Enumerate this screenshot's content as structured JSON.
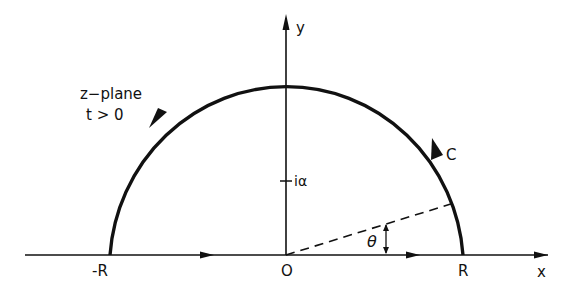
{
  "diagram": {
    "title_lines": [
      "z−plane",
      "t > 0"
    ],
    "axes": {
      "x_label": "x",
      "y_label": "y",
      "origin_label": "O"
    },
    "points": {
      "neg_R": "-R",
      "R": "R",
      "i_alpha": "iα"
    },
    "contour_label": "C",
    "angle_label": "θ",
    "colors": {
      "ink": "#111111",
      "background": "#ffffff"
    }
  }
}
